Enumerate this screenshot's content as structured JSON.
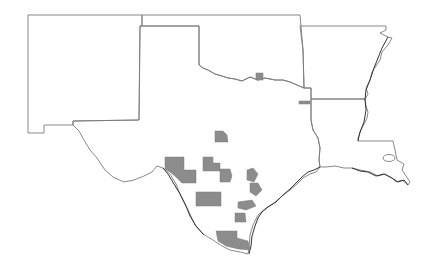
{
  "map": {
    "region": "South-Central United States",
    "states": [
      {
        "name": "New Mexico"
      },
      {
        "name": "Oklahoma"
      },
      {
        "name": "Texas"
      },
      {
        "name": "Arkansas"
      },
      {
        "name": "Louisiana"
      }
    ],
    "colors": {
      "background": "#ffffff",
      "border": "#7a7a7a",
      "coastline": "#333333",
      "highlighted_county": "#8c8c8c"
    },
    "highlighted_areas": [
      {
        "id": "ok-red-river",
        "state": "Oklahoma"
      },
      {
        "id": "tx-ne-border",
        "state": "Texas"
      },
      {
        "id": "tx-central-north",
        "state": "Texas"
      },
      {
        "id": "tx-edwards-west",
        "state": "Texas"
      },
      {
        "id": "tx-rio-grande",
        "state": "Texas"
      },
      {
        "id": "tx-central-a",
        "state": "Texas"
      },
      {
        "id": "tx-central-b",
        "state": "Texas"
      },
      {
        "id": "tx-east-central",
        "state": "Texas"
      },
      {
        "id": "tx-south-a",
        "state": "Texas"
      },
      {
        "id": "tx-coastal-bend",
        "state": "Texas"
      },
      {
        "id": "tx-coastal-south",
        "state": "Texas"
      },
      {
        "id": "tx-lower-valley",
        "state": "Texas"
      }
    ]
  }
}
